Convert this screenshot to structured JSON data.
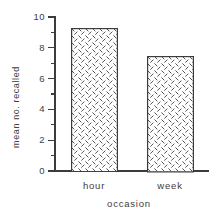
{
  "figure": {
    "background": "#ffffff",
    "ink_color": "#3c3c3c",
    "pattern_ink_color": "#4a4a4a"
  },
  "chart_data": {
    "type": "bar",
    "title": "",
    "xlabel": "occasion",
    "ylabel": "mean no. recalled",
    "categories": [
      "hour",
      "week"
    ],
    "values": [
      9.3,
      7.5
    ],
    "ylim": [
      0,
      10
    ],
    "ytick_major_values": [
      0,
      2,
      4,
      6,
      8,
      10
    ],
    "ytick_major_labels": [
      "0",
      "2",
      "4",
      "6",
      "8",
      "10"
    ],
    "ytick_minor_values": [
      1,
      3,
      5,
      7,
      9
    ],
    "bar_fill": "diagonal-dash-pattern",
    "bar_fill_background": "#ffffff",
    "bar_outline": "#3c3c3c",
    "grid": false,
    "legend": false
  }
}
